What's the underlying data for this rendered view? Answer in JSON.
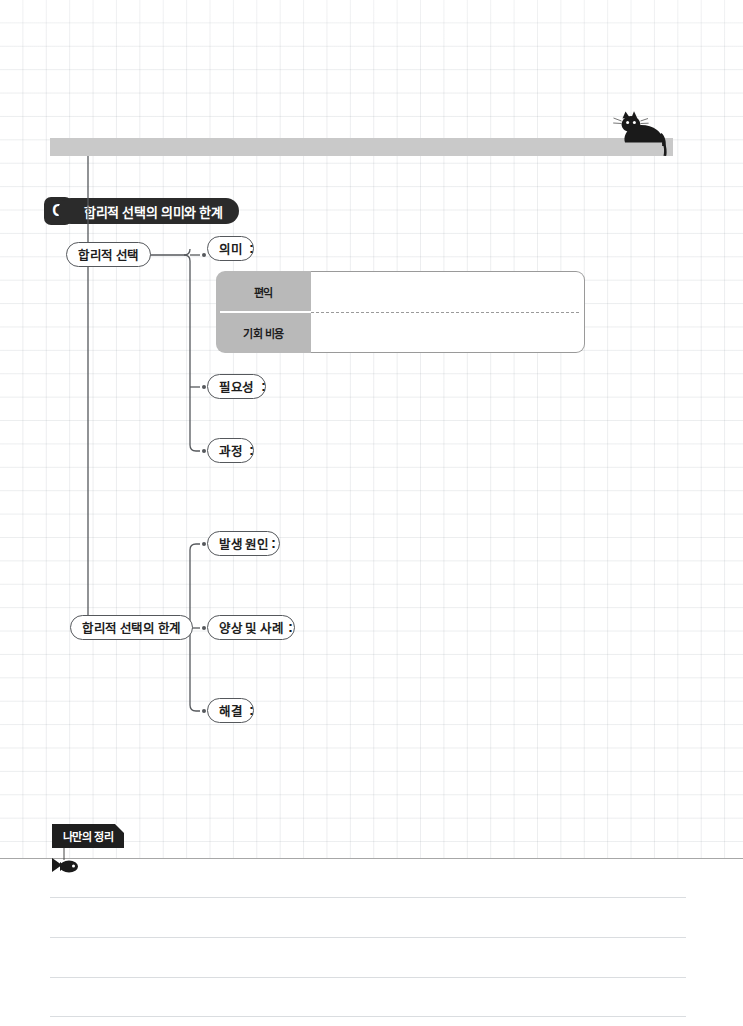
{
  "worksheet": {
    "badge": "C",
    "title": "합리적 선택의 의미와 한계",
    "topbar_label": ""
  },
  "icons": {
    "cat": "cat-icon",
    "fish": "fish-icon"
  },
  "branches": [
    {
      "id": "rational-choice",
      "label": "합리적 선택",
      "children": [
        {
          "id": "meaning",
          "label": "의미",
          "colon": ":"
        },
        {
          "id": "necessity",
          "label": "필요성",
          "colon": ":"
        },
        {
          "id": "process",
          "label": "과정",
          "colon": ":"
        }
      ]
    },
    {
      "id": "limits-of-rational-choice",
      "label": "합리적 선택의 한계",
      "children": [
        {
          "id": "cause",
          "label": "발생 원인",
          "colon": ":"
        },
        {
          "id": "patterns",
          "label": "양상 및 사례",
          "colon": ":"
        },
        {
          "id": "solution",
          "label": "해결",
          "colon": ":"
        }
      ]
    }
  ],
  "table": {
    "rows": [
      {
        "header": "편익",
        "value": ""
      },
      {
        "header": "기회 비용",
        "value": ""
      }
    ]
  },
  "memo": {
    "tab_label": "나만의 정리",
    "lines": [
      "",
      "",
      "",
      ""
    ]
  },
  "colors": {
    "ink": "#1d1d1d",
    "pill_dark": "#2b2b2b",
    "bar_gray": "#c9c9c9",
    "table_header_gray": "#b9b9b9",
    "node_border": "#55585c",
    "grid_line": "#8e96a0",
    "rule_line": "#dadde0"
  }
}
